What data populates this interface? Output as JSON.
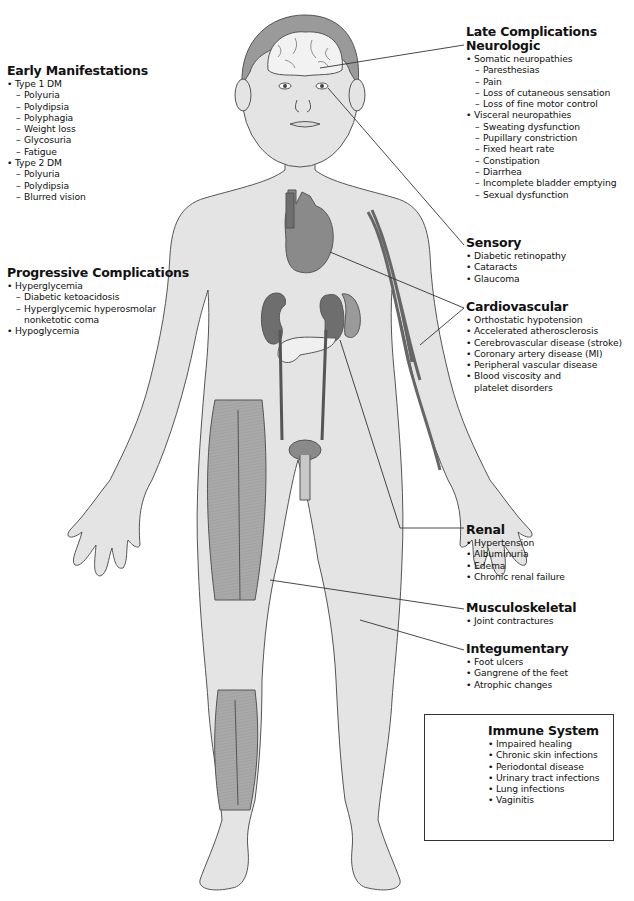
{
  "figure": {
    "colors": {
      "skin": "#e4e4e4",
      "outline": "#555555",
      "organ": "#8a8a8a",
      "organ_dark": "#6e6e6e",
      "muscle": "#a8a8a8",
      "brain": "#f2f2f2",
      "hair": "#9a9a9a",
      "text": "#111111"
    }
  },
  "early": {
    "title": "Early Manifestations",
    "groups": [
      {
        "label": "Type 1 DM",
        "items": [
          "Polyuria",
          "Polydipsia",
          "Polyphagia",
          "Weight loss",
          "Glycosuria",
          "Fatigue"
        ]
      },
      {
        "label": "Type 2 DM",
        "items": [
          "Polyuria",
          "Polydipsia",
          "Blurred vision"
        ]
      }
    ]
  },
  "progressive": {
    "title": "Progressive Complications",
    "hyper": "Hyperglycemia",
    "hyper_items": [
      "Diabetic ketoacidosis",
      "Hyperglycemic hyperosmolar"
    ],
    "hyper_item_cont": "nonketotic coma",
    "hypo": "Hypoglycemia"
  },
  "late": {
    "title": "Late Complications",
    "neuro": {
      "title": "Neurologic",
      "somatic": "Somatic neuropathies",
      "somatic_items": [
        "Paresthesias",
        "Pain",
        "Loss of cutaneous sensation",
        "Loss of fine motor control"
      ],
      "visceral": "Visceral neuropathies",
      "visceral_items": [
        "Sweating dysfunction",
        "Pupillary constriction",
        "Fixed heart rate",
        "Constipation",
        "Diarrhea",
        "Incomplete bladder emptying",
        "Sexual dysfunction"
      ]
    }
  },
  "sensory": {
    "title": "Sensory",
    "items": [
      "Diabetic retinopathy",
      "Cataracts",
      "Glaucoma"
    ]
  },
  "cardio": {
    "title": "Cardiovascular",
    "items": [
      "Orthostatic hypotension",
      "Accelerated atherosclerosis",
      "Cerebrovascular disease (stroke)",
      "Coronary artery disease (MI)",
      "Peripheral vascular disease",
      "Blood viscosity and"
    ],
    "cont": "platelet disorders"
  },
  "renal": {
    "title": "Renal",
    "items": [
      "Hypertension",
      "Albuminuria",
      "Edema",
      "Chronic renal failure"
    ]
  },
  "musculo": {
    "title": "Musculoskeletal",
    "items": [
      "Joint contractures"
    ]
  },
  "integ": {
    "title": "Integumentary",
    "items": [
      "Foot ulcers",
      "Gangrene of the feet",
      "Atrophic changes"
    ]
  },
  "immune": {
    "title": "Immune System",
    "items": [
      "Impaired healing",
      "Chronic skin infections",
      "Periodontal disease",
      "Urinary tract infections",
      "Lung infections",
      "Vaginitis"
    ]
  }
}
